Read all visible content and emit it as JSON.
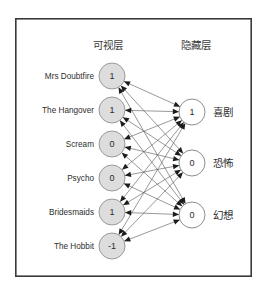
{
  "figure": {
    "frame": {
      "x": 15,
      "y": 18,
      "width": 237,
      "height": 259,
      "border_color": "#3a3a3a",
      "background": "#ffffff"
    }
  },
  "headers": {
    "visible_layer": "可视层",
    "hidden_layer": "隐藏层"
  },
  "colors": {
    "visible_node_fill": "#dddddd",
    "visible_node_stroke": "#9a9a9a",
    "hidden_node_fill": "#ffffff",
    "hidden_node_stroke": "#8e8e8e",
    "edge": "#5a5a5a",
    "arrow": "#1c1c1c",
    "text": "#2e2e2e"
  },
  "chart_data": {
    "type": "diagram",
    "layout": "bipartite-fully-connected",
    "edges_bidirectional": true,
    "visible_layer": {
      "name": "可视层",
      "x": 112,
      "radius": 13,
      "nodes": [
        {
          "label": "Mrs Doubtfire",
          "value": "1",
          "y": 76
        },
        {
          "label": "The Hangover",
          "value": "1",
          "y": 110
        },
        {
          "label": "Scream",
          "value": "0",
          "y": 144
        },
        {
          "label": "Psycho",
          "value": "0",
          "y": 178
        },
        {
          "label": "Bridesmaids",
          "value": "1",
          "y": 212
        },
        {
          "label": "The Hobbit",
          "value": "-1",
          "y": 246
        }
      ]
    },
    "hidden_layer": {
      "name": "隐藏层",
      "x": 192,
      "radius": 13,
      "nodes": [
        {
          "label": "喜剧",
          "value": "1",
          "y": 112
        },
        {
          "label": "恐怖",
          "value": "0",
          "y": 163
        },
        {
          "label": "幻想",
          "value": "0",
          "y": 215
        }
      ]
    }
  }
}
